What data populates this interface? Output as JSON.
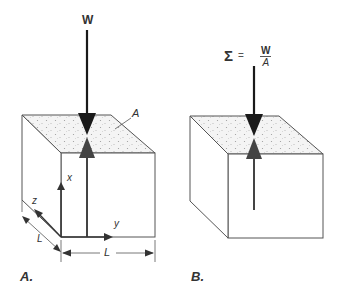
{
  "figure": {
    "panels": [
      {
        "id": "A",
        "label": "A.",
        "force_label": "W",
        "area_label": "A",
        "axes": {
          "x": "x",
          "y": "y",
          "z": "z"
        },
        "dimensions": {
          "depth": "L",
          "width": "L"
        }
      },
      {
        "id": "B",
        "label": "B.",
        "stress_equation": {
          "lhs": "Σ",
          "equals": "=",
          "numerator": "W",
          "denominator": "A"
        }
      }
    ],
    "colors": {
      "line": "#555555",
      "arrow_down": "#1a1a1a",
      "arrow_up": "#444444",
      "stipple_bg": "#f2f2f2",
      "stipple_dot": "#9a9a9a"
    }
  }
}
